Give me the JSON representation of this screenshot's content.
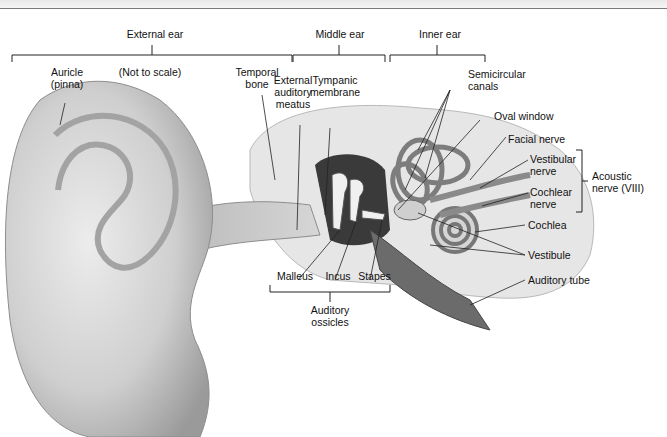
{
  "diagram": {
    "scale_note": "(Not to scale)",
    "regions": [
      {
        "id": "external",
        "label": "External ear"
      },
      {
        "id": "middle",
        "label": "Middle ear"
      },
      {
        "id": "inner",
        "label": "Inner ear"
      }
    ],
    "labels": {
      "auricle": "Auricle\n(pinna)",
      "temporal_bone": "Temporal\nbone",
      "external_auditory_meatus": "External\nauditory\nmeatus",
      "tympanic_membrane": "Tympanic\nmembrane",
      "semicircular_canals": "Semicircular\ncanals",
      "oval_window": "Oval window",
      "facial_nerve": "Facial nerve",
      "vestibular_nerve": "Vestibular\nnerve",
      "cochlear_nerve": "Cochlear\nnerve",
      "acoustic_nerve": "Acoustic\nnerve (VIII)",
      "cochlea": "Cochlea",
      "vestibule": "Vestibule",
      "auditory_tube": "Auditory tube",
      "malleus": "Malleus",
      "incus": "Incus",
      "stapes": "Stapes",
      "auditory_ossicles": "Auditory\nossicles"
    },
    "colors": {
      "skin": "#d9d9d9",
      "skin_shadow": "#9e9e9e",
      "bone": "#e6e6e6",
      "cavity": "#3a3a3a",
      "lines": "#222222"
    }
  }
}
